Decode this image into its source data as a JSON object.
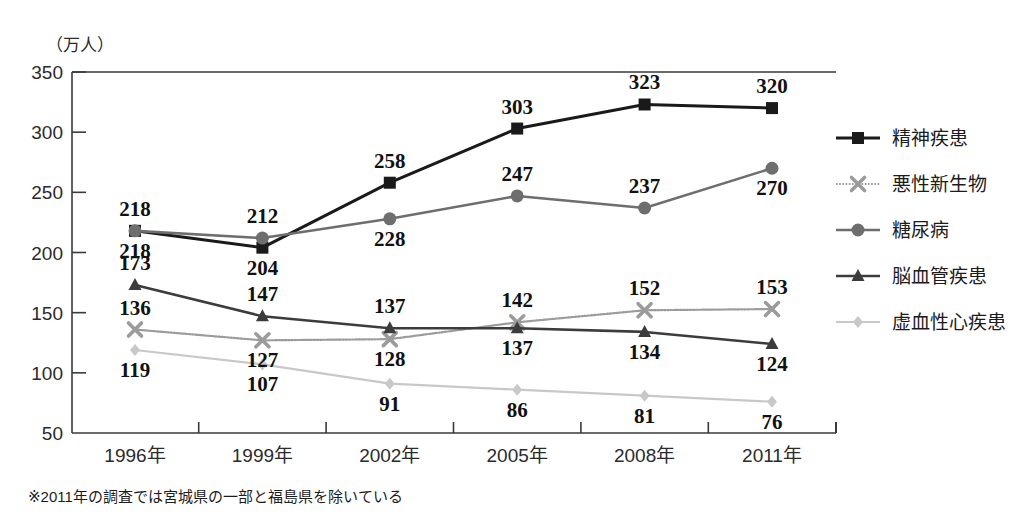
{
  "chart_data": {
    "type": "line",
    "title": "",
    "subtitle": "",
    "xlabel": "",
    "ylabel": "（万人）",
    "unit_label": "（万人）",
    "categories": [
      "1996年",
      "1999年",
      "2002年",
      "2005年",
      "2008年",
      "2011年"
    ],
    "ylim": [
      50,
      350
    ],
    "yticks": [
      50,
      100,
      150,
      200,
      250,
      300,
      350
    ],
    "ytick_labels": [
      "50",
      "100",
      "150",
      "200",
      "250",
      "300",
      "350"
    ],
    "grid": false,
    "legend_position": "right",
    "series": [
      {
        "name": "精神疾患",
        "color": "#1a1a1a",
        "marker": "square",
        "line_width": 3.0,
        "line_style": "solid",
        "values": [
          218,
          204,
          258,
          303,
          323,
          320
        ],
        "label_offsets": [
          -1,
          1,
          -1,
          -1,
          -1,
          -1
        ]
      },
      {
        "name": "悪性新生物",
        "color": "#9b9b9b",
        "marker": "x",
        "line_width": 2.2,
        "line_style": "dotted",
        "values": [
          136,
          127,
          128,
          142,
          152,
          153
        ],
        "label_offsets": [
          -1,
          1,
          1,
          -1,
          -1,
          -1
        ]
      },
      {
        "name": "糖尿病",
        "color": "#6e6e6e",
        "marker": "circle",
        "line_width": 2.6,
        "line_style": "solid",
        "values": [
          218,
          212,
          228,
          247,
          237,
          270
        ],
        "label_offsets": [
          1,
          -1,
          1,
          -1,
          -1,
          1
        ]
      },
      {
        "name": "脳血管疾患",
        "color": "#3c3c3c",
        "marker": "triangle",
        "line_width": 2.6,
        "line_style": "solid",
        "values": [
          173,
          147,
          137,
          137,
          134,
          124
        ],
        "label_offsets": [
          -1,
          -1,
          -1,
          1,
          1,
          1
        ]
      },
      {
        "name": "虚血性心疾患",
        "color": "#c8c8c8",
        "marker": "diamond",
        "line_width": 2.2,
        "line_style": "solid",
        "values": [
          119,
          107,
          91,
          86,
          81,
          76
        ],
        "label_offsets": [
          1,
          1,
          1,
          1,
          1,
          1
        ]
      }
    ]
  },
  "footnote": {
    "text": "※2011年の調査では宮城県の一部と福島県を除いている"
  },
  "legend": {
    "items": [
      {
        "label": "精神疾患"
      },
      {
        "label": "悪性新生物"
      },
      {
        "label": "糖尿病"
      },
      {
        "label": "脳血管疾患"
      },
      {
        "label": "虚血性心疾患"
      }
    ]
  },
  "colors": {
    "background": "#ffffff",
    "axis": "#3a3a3a",
    "text": "#1a1a1a"
  }
}
